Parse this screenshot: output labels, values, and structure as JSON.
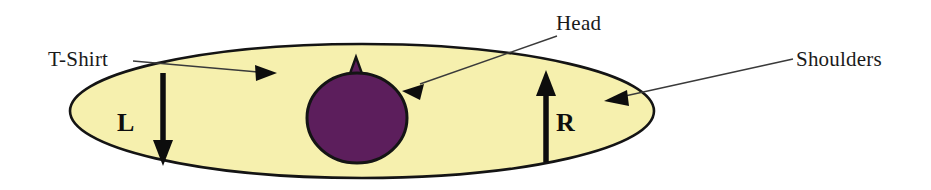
{
  "diagram": {
    "canvas": {
      "width": 931,
      "height": 190,
      "background": "#ffffff"
    },
    "colors": {
      "shirt_fill": "#F6F0AE",
      "head_fill": "#5C1E5C",
      "outline": "#141414",
      "leader_line": "#3a3a3a",
      "text": "#1a1a1a"
    },
    "labels": {
      "tshirt": "T-Shirt",
      "head": "Head",
      "shoulders": "Shoulders"
    },
    "markers": {
      "left": "L",
      "right": "R"
    },
    "shapes": {
      "torso_ellipse": {
        "cx": 362,
        "cy": 111,
        "rx": 292,
        "ry": 67,
        "fill": "#F6F0AE"
      },
      "head_ellipse": {
        "cx": 357,
        "cy": 118,
        "rx": 50,
        "ry": 45,
        "fill": "#5C1E5C"
      },
      "nose_triangle": {
        "apex_x": 356,
        "apex_y": 57,
        "base_half_width": 12,
        "base_y": 86
      }
    },
    "arrows": {
      "left_down": {
        "x": 163,
        "y_start": 73,
        "y_end": 162,
        "direction": "down",
        "label": "L"
      },
      "right_up": {
        "x": 546,
        "y_start": 162,
        "y_end": 73,
        "direction": "up",
        "label": "R"
      }
    },
    "leaders": [
      {
        "name": "tshirt-leader",
        "from_x": 133,
        "from_y": 62,
        "to_x": 268,
        "to_y": 74,
        "points_to": "T-Shirt"
      },
      {
        "name": "head-leader",
        "from_x": 556,
        "from_y": 36,
        "to_x": 406,
        "to_y": 89,
        "points_to": "Head"
      },
      {
        "name": "shoulders-leader",
        "from_x": 793,
        "from_y": 60,
        "to_x": 608,
        "to_y": 101,
        "points_to": "Shoulders"
      }
    ]
  }
}
